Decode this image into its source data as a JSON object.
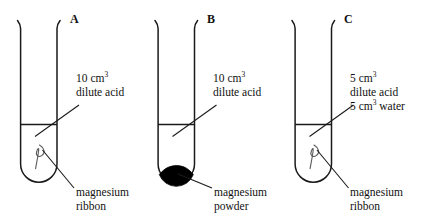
{
  "diagram": {
    "title_letters": [
      "A",
      "B",
      "C"
    ],
    "stroke_color": "#1a1a1a",
    "powder_color": "#000000",
    "background_color": "#ffffff",
    "tubes": [
      {
        "letter": "A",
        "contents_label": {
          "line1_volume": "10 cm",
          "line1_exponent": "3",
          "line2": "dilute acid"
        },
        "solid_label": {
          "line1": "magnesium",
          "line2": "ribbon"
        },
        "solid_type": "ribbon"
      },
      {
        "letter": "B",
        "contents_label": {
          "line1_volume": "10 cm",
          "line1_exponent": "3",
          "line2": "dilute acid"
        },
        "solid_label": {
          "line1": "magnesium",
          "line2": "powder"
        },
        "solid_type": "powder"
      },
      {
        "letter": "C",
        "contents_label": {
          "line1_volume": "5 cm",
          "line1_exponent": "3",
          "line2": "dilute acid",
          "line3_volume": "5 cm",
          "line3_exponent": "3",
          "line3_suffix": " water"
        },
        "solid_label": {
          "line1": "magnesium",
          "line2": "ribbon"
        },
        "solid_type": "ribbon"
      }
    ]
  }
}
